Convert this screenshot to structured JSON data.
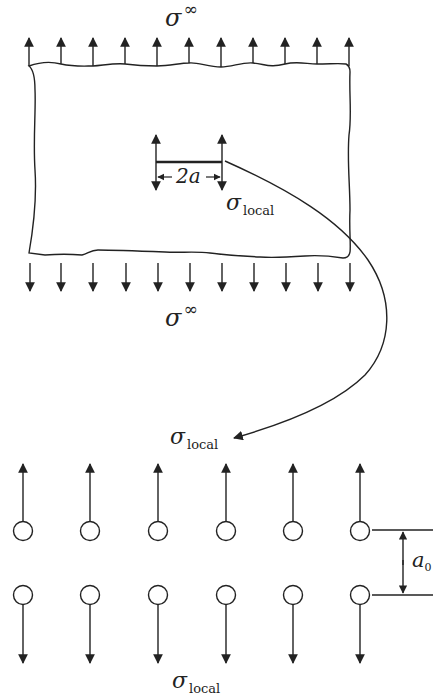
{
  "diagram": {
    "title_top": {
      "symbol": "σ",
      "superscript": "∞"
    },
    "title_bottom": {
      "symbol": "σ",
      "superscript": "∞"
    },
    "crack": {
      "length_label": "2a",
      "stress_label": {
        "symbol": "σ",
        "subscript": "local"
      }
    },
    "zoom_target_label": {
      "symbol": "σ",
      "subscript": "local"
    },
    "atom_spacing_label": {
      "symbol": "a",
      "subscript": "0"
    },
    "atomic_bottom_label": {
      "symbol": "σ",
      "subscript": "local"
    },
    "remote_arrows_count": 11,
    "atom_columns": 6,
    "atom_rows": 2,
    "colors": {
      "line": "#222222",
      "background": "#ffffff"
    }
  }
}
